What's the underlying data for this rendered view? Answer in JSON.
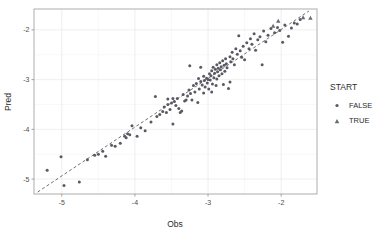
{
  "figure": {
    "width": 382,
    "height": 235,
    "background": "#ffffff"
  },
  "panel": {
    "left": 34,
    "right": 317,
    "top": 9,
    "bottom": 194,
    "background": "#ffffff",
    "border_color": "#9a9a9a",
    "grid_major_color": "#e4e4e8",
    "grid_minor_color": "#f1f1f4"
  },
  "axes": {
    "x_title": "Obs",
    "y_title": "Pred",
    "x_ticks": [
      "-5",
      "-4",
      "-3",
      "-2"
    ],
    "y_ticks": [
      "-2",
      "-3",
      "-4",
      "-5"
    ],
    "x_tick_values": [
      -5,
      -4,
      -3,
      -2
    ],
    "y_tick_values": [
      -2,
      -3,
      -4,
      -5
    ],
    "x_minor_values": [
      -5.5,
      -4.5,
      -3.5,
      -2.5,
      -1.5
    ],
    "y_minor_values": [
      -1.5,
      -2.5,
      -3.5,
      -4.5,
      -5.5
    ],
    "xlim": [
      -5.38,
      -1.51
    ],
    "ylim": [
      -5.3,
      -1.58
    ]
  },
  "legend": {
    "title": "START",
    "title_color": "#2b2b2b",
    "items": [
      {
        "label": "FALSE",
        "marker": "circle",
        "color": "#595963"
      },
      {
        "label": "TRUE",
        "marker": "triangle",
        "color": "#6b6b74"
      }
    ]
  },
  "reference_line": {
    "type": "dashed-identity",
    "color": "#4a4a4a",
    "x1": -5.33,
    "y1": -5.26,
    "x2": -1.62,
    "y2": -1.62
  },
  "chart_data": {
    "type": "scatter",
    "title": "",
    "xlabel": "Obs",
    "ylabel": "Pred",
    "xlim": [
      -5.38,
      -1.51
    ],
    "ylim": [
      -5.3,
      -1.58
    ],
    "grid": true,
    "legend_position": "right",
    "legend_title": "START",
    "series": [
      {
        "name": "FALSE",
        "marker": "circle",
        "color": "#595963",
        "points": [
          [
            -5.2,
            -4.82
          ],
          [
            -5.01,
            -4.55
          ],
          [
            -4.97,
            -5.13
          ],
          [
            -4.76,
            -5.06
          ],
          [
            -4.65,
            -4.61
          ],
          [
            -4.55,
            -4.52
          ],
          [
            -4.5,
            -4.5
          ],
          [
            -4.44,
            -4.44
          ],
          [
            -4.4,
            -4.54
          ],
          [
            -4.32,
            -4.32
          ],
          [
            -4.27,
            -4.34
          ],
          [
            -4.2,
            -4.28
          ],
          [
            -4.14,
            -4.14
          ],
          [
            -4.12,
            -4.17
          ],
          [
            -4.1,
            -4.09
          ],
          [
            -4.07,
            -4.11
          ],
          [
            -4.04,
            -3.93
          ],
          [
            -3.97,
            -4.14
          ],
          [
            -3.92,
            -3.97
          ],
          [
            -3.86,
            -4.03
          ],
          [
            -3.78,
            -3.85
          ],
          [
            -3.72,
            -3.34
          ],
          [
            -3.7,
            -3.74
          ],
          [
            -3.66,
            -3.7
          ],
          [
            -3.62,
            -3.64
          ],
          [
            -3.6,
            -3.55
          ],
          [
            -3.57,
            -3.66
          ],
          [
            -3.55,
            -3.5
          ],
          [
            -3.52,
            -3.6
          ],
          [
            -3.5,
            -3.47
          ],
          [
            -3.48,
            -3.89
          ],
          [
            -3.46,
            -3.44
          ],
          [
            -3.44,
            -3.52
          ],
          [
            -3.42,
            -3.38
          ],
          [
            -3.4,
            -3.58
          ],
          [
            -3.38,
            -3.66
          ],
          [
            -3.36,
            -3.63
          ],
          [
            -3.34,
            -3.3
          ],
          [
            -3.32,
            -3.43
          ],
          [
            -3.3,
            -3.41
          ],
          [
            -3.28,
            -3.33
          ],
          [
            -3.26,
            -3.21
          ],
          [
            -3.24,
            -3.28
          ],
          [
            -3.22,
            -3.41
          ],
          [
            -3.2,
            -3.12
          ],
          [
            -3.18,
            -3.25
          ],
          [
            -3.16,
            -3.08
          ],
          [
            -3.14,
            -3.46
          ],
          [
            -3.13,
            -2.98
          ],
          [
            -3.12,
            -3.19
          ],
          [
            -3.1,
            -3.04
          ],
          [
            -3.08,
            -3.11
          ],
          [
            -3.06,
            -2.93
          ],
          [
            -3.05,
            -3.02
          ],
          [
            -3.04,
            -3.15
          ],
          [
            -3.02,
            -2.97
          ],
          [
            -3.01,
            -3.07
          ],
          [
            -3.0,
            -3.0
          ],
          [
            -2.99,
            -3.19
          ],
          [
            -2.98,
            -2.88
          ],
          [
            -2.97,
            -3.01
          ],
          [
            -2.96,
            -2.92
          ],
          [
            -2.95,
            -2.82
          ],
          [
            -2.94,
            -3.09
          ],
          [
            -2.93,
            -2.75
          ],
          [
            -2.92,
            -2.96
          ],
          [
            -2.91,
            -2.87
          ],
          [
            -2.9,
            -2.79
          ],
          [
            -2.89,
            -3.12
          ],
          [
            -2.88,
            -2.7
          ],
          [
            -2.87,
            -2.84
          ],
          [
            -2.86,
            -2.77
          ],
          [
            -2.85,
            -2.92
          ],
          [
            -2.84,
            -2.66
          ],
          [
            -2.83,
            -2.8
          ],
          [
            -2.82,
            -2.74
          ],
          [
            -2.81,
            -2.88
          ],
          [
            -2.8,
            -2.62
          ],
          [
            -2.79,
            -3.1
          ],
          [
            -2.78,
            -2.71
          ],
          [
            -2.77,
            -2.83
          ],
          [
            -2.76,
            -2.58
          ],
          [
            -2.75,
            -2.68
          ],
          [
            -2.74,
            -2.76
          ],
          [
            -2.72,
            -3.18
          ],
          [
            -2.7,
            -2.54
          ],
          [
            -2.69,
            -2.64
          ],
          [
            -2.67,
            -2.45
          ],
          [
            -2.66,
            -2.58
          ],
          [
            -2.64,
            -2.7
          ],
          [
            -2.62,
            -2.38
          ],
          [
            -2.6,
            -2.49
          ],
          [
            -2.58,
            -2.12
          ],
          [
            -2.56,
            -2.42
          ],
          [
            -2.54,
            -2.55
          ],
          [
            -2.52,
            -2.33
          ],
          [
            -2.5,
            -2.6
          ],
          [
            -2.47,
            -2.26
          ],
          [
            -2.44,
            -2.38
          ],
          [
            -2.42,
            -2.18
          ],
          [
            -2.4,
            -2.29
          ],
          [
            -2.37,
            -2.08
          ],
          [
            -2.35,
            -2.41
          ],
          [
            -2.32,
            -2.2
          ],
          [
            -2.29,
            -2.14
          ],
          [
            -2.26,
            -2.7
          ],
          [
            -2.24,
            -2.02
          ],
          [
            -2.21,
            -2.24
          ],
          [
            -2.18,
            -2.11
          ],
          [
            -2.14,
            -1.97
          ],
          [
            -2.09,
            -2.06
          ],
          [
            -2.05,
            -1.95
          ],
          [
            -2.02,
            -2.01
          ],
          [
            -1.98,
            -2.25
          ],
          [
            -1.95,
            -1.9
          ],
          [
            -1.9,
            -2.13
          ],
          [
            -1.86,
            -1.96
          ],
          [
            -1.82,
            -1.86
          ],
          [
            -1.78,
            -1.88
          ],
          [
            -1.74,
            -1.79
          ],
          [
            -3.25,
            -2.72
          ],
          [
            -3.1,
            -2.75
          ],
          [
            -2.88,
            -2.99
          ],
          [
            -2.7,
            -3.05
          ],
          [
            -3.55,
            -3.39
          ],
          [
            -3.48,
            -3.38
          ],
          [
            -3.06,
            -3.27
          ],
          [
            -2.95,
            -3.25
          ]
        ]
      },
      {
        "name": "TRUE",
        "marker": "triangle",
        "color": "#6b6b74",
        "points": [
          [
            -1.7,
            -1.75
          ],
          [
            -1.6,
            -1.76
          ],
          [
            -2.11,
            -1.92
          ],
          [
            -2.04,
            -1.82
          ]
        ]
      }
    ]
  }
}
